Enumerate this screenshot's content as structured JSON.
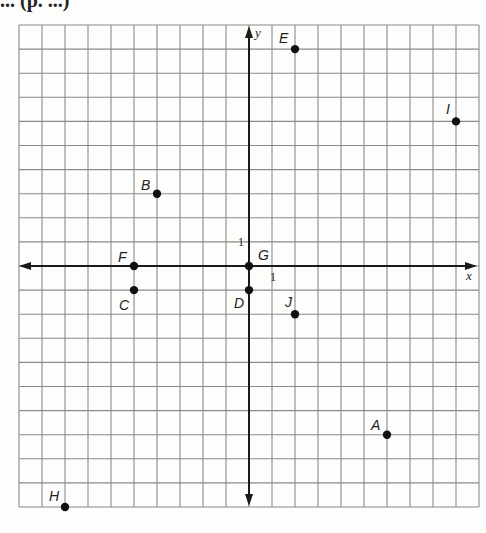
{
  "header": {
    "title_fragment": "... (p. ...)"
  },
  "chart_data": {
    "type": "scatter",
    "title": "",
    "xlabel": "x",
    "ylabel": "y",
    "xlim": [
      -10,
      10
    ],
    "ylim": [
      -10,
      10
    ],
    "grid": true,
    "legend": null,
    "unit_tick_labels": {
      "x": "1",
      "y": "1"
    },
    "points": [
      {
        "label": "A",
        "x": 6,
        "y": -7
      },
      {
        "label": "B",
        "x": -4,
        "y": 3
      },
      {
        "label": "C",
        "x": -5,
        "y": -1
      },
      {
        "label": "D",
        "x": 0,
        "y": -1
      },
      {
        "label": "E",
        "x": 2,
        "y": 9
      },
      {
        "label": "F",
        "x": -5,
        "y": 0
      },
      {
        "label": "G",
        "x": 0,
        "y": 0
      },
      {
        "label": "H",
        "x": -8,
        "y": -10
      },
      {
        "label": "I",
        "x": 9,
        "y": 6
      },
      {
        "label": "J",
        "x": 2,
        "y": -2
      }
    ]
  },
  "colors": {
    "grid": "#8a8a8a",
    "axis": "#1a1a1a",
    "point": "#111111",
    "background": "#fdfdfb"
  }
}
